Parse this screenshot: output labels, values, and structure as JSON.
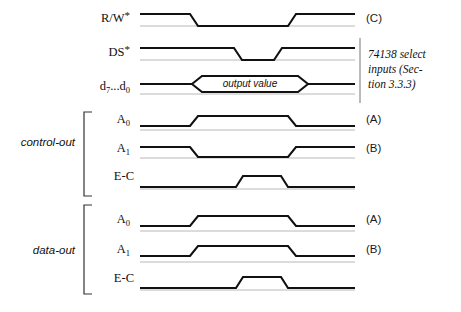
{
  "figure": {
    "width": 461,
    "height": 312,
    "background": "#ffffff",
    "wave_color": "#111111",
    "baseline_color": "#b8b8b8"
  },
  "bus_envelope": {
    "label": "output value"
  },
  "annotation": {
    "line1": "74138 select",
    "line2": "inputs (Sec-",
    "line3": "tion 3.3.3)"
  },
  "groups": [
    {
      "name": "control-out",
      "label": "control-out"
    },
    {
      "name": "data-out",
      "label": "data-out"
    }
  ],
  "signals": [
    {
      "id": "rw",
      "label_main": "R/W",
      "label_sub": "",
      "label_star": "*",
      "right_label": "(C)",
      "group": "",
      "waveform": "high-low-high",
      "transitions": [
        196,
        295
      ]
    },
    {
      "id": "ds",
      "label_main": "DS",
      "label_sub": "",
      "label_star": "*",
      "right_label": "",
      "group": "",
      "waveform": "high-low-high",
      "transitions": [
        238,
        278
      ]
    },
    {
      "id": "data-bus",
      "label_main": "d",
      "label_sub": "7",
      "label_main2": "...d",
      "label_sub2": "0",
      "label_star": "",
      "right_label": "",
      "group": "",
      "waveform": "bus",
      "transitions": [
        192,
        305
      ]
    },
    {
      "id": "control-a0",
      "label_main": "A",
      "label_sub": "0",
      "label_star": "",
      "right_label": "(A)",
      "group": "control-out",
      "waveform": "low-high-low",
      "transitions": [
        195,
        295
      ]
    },
    {
      "id": "control-a1",
      "label_main": "A",
      "label_sub": "1",
      "label_star": "",
      "right_label": "(B)",
      "group": "control-out",
      "waveform": "high-low-high",
      "transitions": [
        195,
        295
      ]
    },
    {
      "id": "control-ec",
      "label_main": "E-C",
      "label_sub": "",
      "label_star": "",
      "right_label": "",
      "group": "control-out",
      "waveform": "low-high-low",
      "transitions": [
        240,
        285
      ]
    },
    {
      "id": "data-a0",
      "label_main": "A",
      "label_sub": "0",
      "label_star": "",
      "right_label": "(A)",
      "group": "data-out",
      "waveform": "low-high-low",
      "transitions": [
        195,
        295
      ]
    },
    {
      "id": "data-a1",
      "label_main": "A",
      "label_sub": "1",
      "label_star": "",
      "right_label": "(B)",
      "group": "data-out",
      "waveform": "low-high-low",
      "transitions": [
        195,
        295
      ]
    },
    {
      "id": "data-ec",
      "label_main": "E-C",
      "label_sub": "",
      "label_star": "",
      "right_label": "",
      "group": "data-out",
      "waveform": "low-high-low",
      "transitions": [
        240,
        285
      ]
    }
  ]
}
